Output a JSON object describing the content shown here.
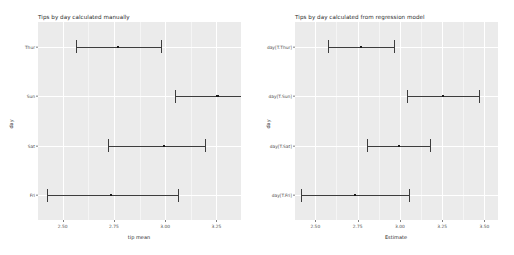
{
  "figure": {
    "background_color": "#ffffff",
    "panel_color": "#ebebeb",
    "grid_color": "#ffffff",
    "point_color": "#1a1a1a",
    "errorbar_color": "#3d3d3d"
  },
  "chart_data": [
    {
      "type": "scatter",
      "title": "Tips by day calculated manually",
      "xlabel": "tip mean",
      "ylabel": "day",
      "xlim": [
        2.38,
        3.37
      ],
      "xticks": [
        2.5,
        2.75,
        3.0,
        3.25
      ],
      "xticklabels": [
        "2.50",
        "2.75",
        "3.00",
        "3.25"
      ],
      "grid": true,
      "legend": "none",
      "orientation": "horizontal",
      "categories": [
        "Thur",
        "Sun",
        "Sat",
        "Fri"
      ],
      "points": [
        {
          "category": "Thur",
          "estimate": 2.771,
          "ci_low": 2.565,
          "ci_high": 2.982
        },
        {
          "category": "Sun",
          "estimate": 3.255,
          "ci_low": 3.046,
          "ci_high": 3.468
        },
        {
          "category": "Sat",
          "estimate": 2.993,
          "ci_low": 2.72,
          "ci_high": 3.196
        },
        {
          "category": "Fri",
          "estimate": 2.735,
          "ci_low": 2.424,
          "ci_high": 3.062
        }
      ]
    },
    {
      "type": "scatter",
      "title": "Tips by day calculated from regression model",
      "xlabel": "Estimate",
      "ylabel": "day",
      "xlim": [
        2.38,
        3.58
      ],
      "xticks": [
        2.5,
        2.75,
        3.0,
        3.25,
        3.5
      ],
      "xticklabels": [
        "2.50",
        "2.75",
        "3.00",
        "3.25",
        "3.50"
      ],
      "grid": true,
      "legend": "none",
      "orientation": "horizontal",
      "categories": [
        "day[T.Thur]",
        "day[T.Sun]",
        "day[T.Sat]",
        "day[T.Fri]"
      ],
      "points": [
        {
          "category": "day[T.Thur]",
          "estimate": 2.771,
          "ci_low": 2.578,
          "ci_high": 2.964
        },
        {
          "category": "day[T.Sun]",
          "estimate": 3.255,
          "ci_low": 3.043,
          "ci_high": 3.467
        },
        {
          "category": "day[T.Sat]",
          "estimate": 2.993,
          "ci_low": 2.807,
          "ci_high": 3.18
        },
        {
          "category": "day[T.Fri]",
          "estimate": 2.735,
          "ci_low": 2.418,
          "ci_high": 3.052
        }
      ]
    }
  ]
}
